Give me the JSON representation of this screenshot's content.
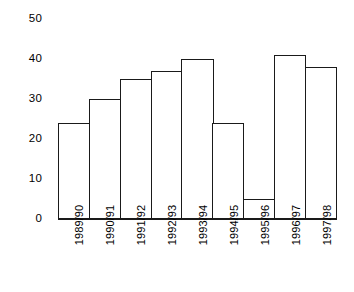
{
  "chart_data": {
    "type": "bar",
    "title": "",
    "subtitle": "",
    "xlabel": "",
    "ylabel": "",
    "categories": [
      "1989/90",
      "1990/91",
      "1991/92",
      "1992/93",
      "1993/94",
      "1994/95",
      "1995/96",
      "1996/97",
      "1997/98"
    ],
    "values": [
      24,
      30,
      35,
      37,
      40,
      24,
      5,
      41,
      38
    ],
    "ylim": [
      0,
      50
    ],
    "yticks": [
      0,
      10,
      20,
      30,
      40,
      50
    ],
    "ytick_labels": [
      "0",
      "10",
      "20",
      "30",
      "40",
      "50"
    ],
    "grid": false,
    "legend": false,
    "bar_style": {
      "fill": "#ffffff",
      "edge": "#1a1a1a",
      "gap": 0
    }
  }
}
